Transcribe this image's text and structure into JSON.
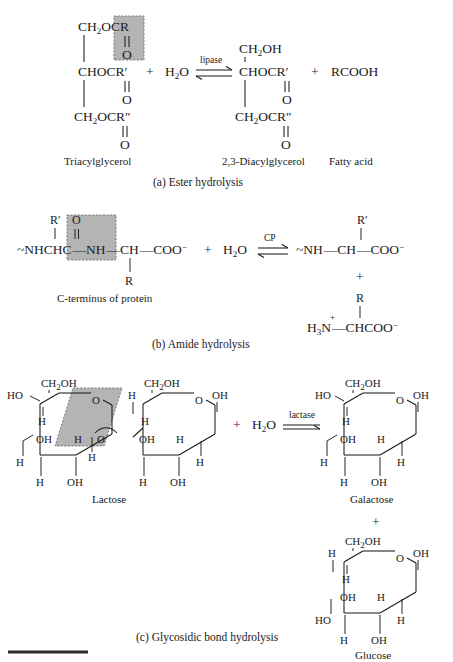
{
  "figure": {
    "bottom_rule": true
  },
  "panels": [
    {
      "id": "a",
      "caption": "(a) Ester hydrolysis",
      "enzyme": "lipase",
      "arrow": "equilibrium",
      "water": "H2O",
      "plus": "+",
      "reactant": {
        "name": "Triacylglycerol",
        "lines": [
          "CH2OCR",
          "O",
          "CHOCR′",
          "O",
          "CH2OCR″",
          "O"
        ],
        "top_group": "CH",
        "top_sub": "2",
        "top_rest": "OCR",
        "mid_group": "CHOCR′",
        "bot_group": "CH",
        "bot_sub": "2",
        "bot_rest": "OCR″",
        "carbonyl_o": "O",
        "highlight": "ester bond"
      },
      "products": [
        {
          "name": "2,3-Diacylglycerol",
          "top_group": "CH",
          "top_sub": "2",
          "top_rest": "OH",
          "mid_group": "CHOCR′",
          "bot_group": "CH",
          "bot_sub": "2",
          "bot_rest": "OCR″",
          "carbonyl_o": "O"
        },
        {
          "name": "Fatty acid",
          "formula": "RCOOH"
        }
      ]
    },
    {
      "id": "b",
      "caption": "(b) Amide hydrolysis",
      "enzyme": "CP",
      "arrow": "equilibrium",
      "water": "H2O",
      "plus": "+",
      "reactant": {
        "name": "C-terminus of protein",
        "backbone": "~NHCHC—NH—CH—COO⁻",
        "r_prime": "R′",
        "carbonyl_o": "O",
        "r_group": "R",
        "highlight": "amide (peptide) bond"
      },
      "products": [
        {
          "name": "shortened peptide",
          "backbone": "~NH—CH—COO⁻",
          "r_prime": "R′"
        },
        {
          "name": "free amino acid",
          "backbone": "H3N⁺—CHCOO⁻",
          "r_group": "R"
        }
      ],
      "middle_plus": "+"
    },
    {
      "id": "c",
      "caption": "(c) Glycosidic bond hydrolysis",
      "enzyme": "lactase",
      "arrow": "forward",
      "water": "H2O",
      "plus": "+",
      "reactant": {
        "name": "Lactose",
        "highlight": "glycosidic bond",
        "galactose_ring_labels": {
          "ch2oh": "CH2OH",
          "ho": "HO",
          "ring_o": "O",
          "h_upper": "H",
          "oh_upper": "OH",
          "h_left": "H",
          "h_bottom_left": "H",
          "oh_bottom": "OH",
          "h_inner": "H",
          "h_lower": "H",
          "link_o": "O"
        },
        "glucose_ring_labels": {
          "ch2oh": "CH2OH",
          "h_left": "H",
          "ring_o": "O",
          "oh_right": "OH",
          "h_upper": "H",
          "oh_upper": "OH",
          "h_inner": "H",
          "h_right": "H",
          "h_bottom_left": "H",
          "oh_bottom": "OH"
        }
      },
      "products": [
        {
          "name": "Galactose",
          "labels": {
            "ch2oh": "CH2OH",
            "ho": "HO",
            "ring_o": "O",
            "oh_right": "OH",
            "h_upper": "H",
            "oh_upper": "OH",
            "h_inner": "H",
            "h_left": "H",
            "h_right": "H",
            "h_bottom_left": "H",
            "oh_bottom": "OH"
          }
        },
        {
          "name": "Glucose",
          "labels": {
            "ch2oh": "CH2OH",
            "h_topleft": "H",
            "ring_o": "O",
            "oh_right": "OH",
            "h_upper": "H",
            "oh_upper": "OH",
            "h_inner": "H",
            "ho_left": "HO",
            "h_right": "H",
            "h_bottom_left": "H",
            "oh_bottom": "OH"
          }
        }
      ],
      "products_plus": "+"
    }
  ],
  "colors": {
    "highlight_fill": "#b4b4b4",
    "highlight_stroke": "#6e6e6e",
    "ink": "#1a1a1a"
  }
}
